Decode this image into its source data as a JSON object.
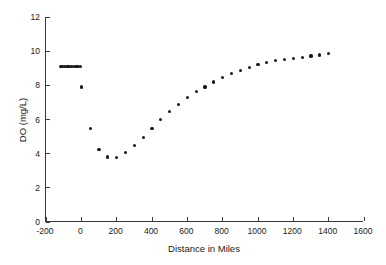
{
  "chart_data": {
    "type": "scatter",
    "title": "",
    "xlabel": "Distance in Miles",
    "ylabel": "DO (mg/L)",
    "xlim": [
      -200,
      1600
    ],
    "ylim": [
      0,
      12
    ],
    "xticks": [
      -200,
      0,
      200,
      400,
      600,
      800,
      1000,
      1200,
      1400,
      1600
    ],
    "xtick_labels": [
      "-200",
      "0",
      "200",
      "400",
      "600",
      "800",
      "1000",
      "1200",
      "1400",
      "1600"
    ],
    "yticks": [
      0,
      2,
      4,
      6,
      8,
      10,
      12
    ],
    "ytick_labels": [
      "0",
      "2",
      "4",
      "6",
      "8",
      "10",
      "12"
    ],
    "grid": false,
    "legend": null,
    "marker": "filled-circle",
    "marker_color": "#1a1a1a",
    "series": [
      {
        "name": "Dissolved Oxygen",
        "x": [
          -115,
          -105,
          -95,
          -85,
          -75,
          -65,
          -55,
          -45,
          -35,
          -25,
          -15,
          -5,
          0,
          50,
          100,
          150,
          200,
          250,
          300,
          350,
          400,
          450,
          500,
          550,
          600,
          650,
          700,
          750,
          800,
          850,
          900,
          950,
          1000,
          1050,
          1100,
          1150,
          1200,
          1250,
          1300,
          1350,
          1400
        ],
        "y": [
          9.1,
          9.1,
          9.1,
          9.1,
          9.1,
          9.1,
          9.1,
          9.1,
          9.1,
          9.1,
          9.1,
          9.1,
          7.9,
          5.45,
          4.25,
          3.8,
          3.78,
          4.07,
          4.48,
          4.97,
          5.48,
          6.0,
          6.45,
          6.87,
          7.28,
          7.63,
          7.9,
          8.2,
          8.47,
          8.67,
          8.87,
          9.05,
          9.2,
          9.33,
          9.45,
          9.53,
          9.58,
          9.65,
          9.72,
          9.78,
          9.85
        ]
      }
    ]
  }
}
